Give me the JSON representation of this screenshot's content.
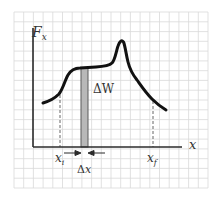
{
  "diagram": {
    "labels": {
      "y_axis": "F",
      "y_axis_sub": "x",
      "x_axis": "x",
      "x_initial": "x",
      "x_initial_sub": "i",
      "x_final": "x",
      "x_final_sub": "f",
      "strip_area": "ΔW",
      "strip_width": "Δx"
    },
    "colors": {
      "grid": "#d9d9d9",
      "axes": "#2b2b2b",
      "curve": "#111111",
      "strip_fill": "#b8b8b8",
      "strip_edge": "#5a5a5a",
      "text": "#333333"
    },
    "curve_points": [
      [
        43,
        103
      ],
      [
        52,
        99
      ],
      [
        58,
        95
      ],
      [
        63,
        86
      ],
      [
        67,
        76
      ],
      [
        72,
        70
      ],
      [
        80,
        68
      ],
      [
        95,
        67
      ],
      [
        108,
        66
      ],
      [
        114,
        62
      ],
      [
        118,
        50
      ],
      [
        121,
        42
      ],
      [
        124,
        43
      ],
      [
        127,
        55
      ],
      [
        130,
        65
      ],
      [
        136,
        77
      ],
      [
        145,
        91
      ],
      [
        155,
        103
      ],
      [
        166,
        110
      ]
    ]
  }
}
